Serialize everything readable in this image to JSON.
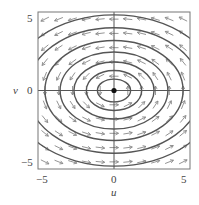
{
  "chart_data": {
    "type": "vector-field",
    "title": "",
    "xlabel": "u",
    "ylabel": "v",
    "xlim": [
      -5.5,
      5.5
    ],
    "ylim": [
      -5.5,
      5.5
    ],
    "xticks": [
      "-5",
      "0",
      "5"
    ],
    "yticks": [
      "-5",
      "0",
      "5"
    ],
    "grid": false,
    "axes_through_origin": true,
    "equilibrium": {
      "u": 0,
      "v": 0,
      "marker": "filled-dot"
    },
    "field_description": "Counterclockwise circulation around the origin: arrows point left in the upper half and right in the lower half; nested closed elliptical orbits (centers).",
    "orbits": [
      {
        "a": 1.2,
        "b": 0.8
      },
      {
        "a": 2.0,
        "b": 1.4
      },
      {
        "a": 2.9,
        "b": 2.0
      },
      {
        "a": 3.9,
        "b": 2.7
      },
      {
        "a": 5.0,
        "b": 3.5
      },
      {
        "a": 6.3,
        "b": 4.4
      },
      {
        "a": 7.6,
        "b": 5.3
      }
    ],
    "arrow_grid": {
      "u_range": [
        -5,
        5
      ],
      "v_range": [
        -5,
        5
      ],
      "step": 1
    }
  },
  "labels": {
    "x_axis": "u",
    "y_axis": "v",
    "x_ticks": [
      "−5",
      "0",
      "5"
    ],
    "y_ticks": [
      "5",
      "0",
      "−5"
    ]
  },
  "colors": {
    "frame": "#777777",
    "orbit": "#555555",
    "arrow": "#888888",
    "background": "#ffffff"
  }
}
